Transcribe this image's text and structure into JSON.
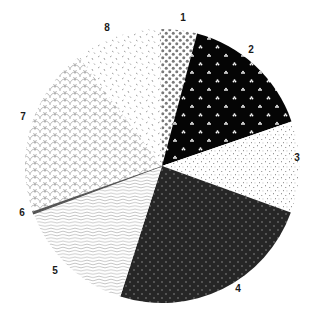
{
  "chart_data": {
    "type": "pie",
    "title": "",
    "start_angle_deg": -1,
    "direction": "clockwise",
    "center": [
      162,
      166
    ],
    "radius": 137,
    "categories": [
      "1",
      "2",
      "3",
      "4",
      "5",
      "6",
      "7",
      "8"
    ],
    "values": [
      4.4,
      15.6,
      10.8,
      24.4,
      14.4,
      0.3,
      20.0,
      10.1
    ],
    "slices": [
      {
        "label": "1",
        "value": 4.4,
        "pattern": "gray-dots-on-white",
        "label_pos": [
          183,
          21
        ]
      },
      {
        "label": "2",
        "value": 15.6,
        "pattern": "white-motif-on-black",
        "label_pos": [
          251,
          53
        ]
      },
      {
        "label": "3",
        "value": 10.8,
        "pattern": "light-speckle-on-white",
        "label_pos": [
          297,
          161
        ]
      },
      {
        "label": "4",
        "value": 24.4,
        "pattern": "light-dots-on-dark",
        "label_pos": [
          238,
          292
        ]
      },
      {
        "label": "5",
        "value": 14.4,
        "pattern": "gray-waves-on-white",
        "label_pos": [
          55,
          274
        ]
      },
      {
        "label": "6",
        "value": 0.3,
        "pattern": "dark-line",
        "label_pos": [
          22,
          216
        ]
      },
      {
        "label": "7",
        "value": 20.0,
        "pattern": "gray-scales-on-white",
        "label_pos": [
          23,
          120
        ]
      },
      {
        "label": "8",
        "value": 10.1,
        "pattern": "gray-dashes-on-white",
        "label_pos": [
          107,
          31
        ]
      }
    ],
    "legend": "none",
    "grid": false
  }
}
